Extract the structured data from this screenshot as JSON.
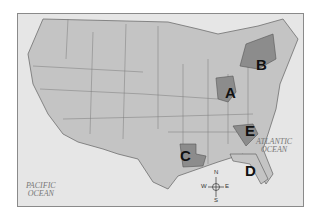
{
  "map": {
    "region": "United States (contiguous)",
    "labels": [
      {
        "letter": "A",
        "state": "Ohio"
      },
      {
        "letter": "B",
        "state": "New York"
      },
      {
        "letter": "C",
        "state": "Louisiana"
      },
      {
        "letter": "D",
        "state": "Florida"
      },
      {
        "letter": "E",
        "state": "South Carolina"
      }
    ],
    "oceans": {
      "atlantic_1": "ATLANTIC",
      "atlantic_2": "OCEAN",
      "pacific_1": "PACIFIC",
      "pacific_2": "OCEAN"
    },
    "compass": {
      "n": "N",
      "s": "S",
      "e": "E",
      "w": "W"
    },
    "colors": {
      "land": "#c4c4c4",
      "highlight": "#8c8c8c",
      "water": "#e6e6e6",
      "border": "#6e6e6e"
    }
  }
}
